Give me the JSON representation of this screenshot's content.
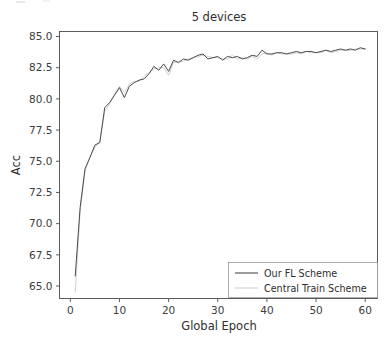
{
  "chart_data": {
    "type": "line",
    "title": "5 devices",
    "xlabel": "Global Epoch",
    "ylabel": "Acc",
    "xlim": [
      -2.2,
      62.5
    ],
    "ylim": [
      64.0,
      85.4
    ],
    "xticks": [
      0,
      10,
      20,
      30,
      40,
      50,
      60
    ],
    "xtick_labels": [
      "0",
      "10",
      "20",
      "30",
      "40",
      "50",
      "60"
    ],
    "yticks": [
      65.0,
      67.5,
      70.0,
      72.5,
      75.0,
      77.5,
      80.0,
      82.5,
      85.0
    ],
    "ytick_labels": [
      "65.0",
      "67.5",
      "70.0",
      "72.5",
      "75.0",
      "77.5",
      "80.0",
      "82.5",
      "85.0"
    ],
    "grid": false,
    "legend_position": "lower right",
    "x": [
      1,
      2,
      3,
      4,
      5,
      6,
      7,
      8,
      9,
      10,
      11,
      12,
      13,
      14,
      15,
      16,
      17,
      18,
      19,
      20,
      21,
      22,
      23,
      24,
      25,
      26,
      27,
      28,
      29,
      30,
      31,
      32,
      33,
      34,
      35,
      36,
      37,
      38,
      39,
      40,
      41,
      42,
      43,
      44,
      45,
      46,
      47,
      48,
      49,
      50,
      51,
      52,
      53,
      54,
      55,
      56,
      57,
      58,
      59,
      60
    ],
    "series": [
      {
        "name": "Our FL Scheme",
        "color": "#4c4c4c",
        "values": [
          65.8,
          71.3,
          74.4,
          75.3,
          76.3,
          76.5,
          79.3,
          79.7,
          80.3,
          80.9,
          80.1,
          81.0,
          81.3,
          81.5,
          81.6,
          82.0,
          82.6,
          82.3,
          82.8,
          82.2,
          83.1,
          82.9,
          83.2,
          83.1,
          83.3,
          83.5,
          83.6,
          83.2,
          83.3,
          83.4,
          83.1,
          83.4,
          83.3,
          83.4,
          83.2,
          83.3,
          83.5,
          83.4,
          83.9,
          83.6,
          83.6,
          83.7,
          83.7,
          83.6,
          83.7,
          83.8,
          83.7,
          83.8,
          83.8,
          83.7,
          83.8,
          83.9,
          83.8,
          83.9,
          84.0,
          83.9,
          84.0,
          83.9,
          84.1,
          84.0
        ]
      },
      {
        "name": "Central Train Scheme",
        "color": "#cfcfcf",
        "values": [
          64.5,
          71.0,
          74.2,
          75.4,
          76.1,
          76.6,
          79.0,
          79.6,
          80.4,
          81.0,
          80.5,
          81.2,
          81.4,
          81.4,
          81.8,
          82.1,
          82.4,
          82.5,
          82.5,
          81.9,
          82.9,
          83.0,
          83.0,
          83.2,
          83.3,
          83.4,
          83.5,
          83.4,
          83.3,
          83.3,
          83.2,
          83.2,
          83.5,
          83.2,
          83.3,
          83.2,
          83.4,
          83.2,
          83.6,
          83.7,
          83.5,
          83.7,
          83.6,
          83.6,
          83.6,
          83.7,
          83.6,
          83.8,
          83.7,
          83.7,
          83.7,
          83.9,
          83.7,
          83.8,
          83.9,
          83.9,
          83.9,
          84.0,
          84.0,
          84.0
        ]
      }
    ]
  },
  "legend": {
    "entries": [
      {
        "label": "Our FL Scheme"
      },
      {
        "label": "Central Train Scheme"
      }
    ]
  }
}
